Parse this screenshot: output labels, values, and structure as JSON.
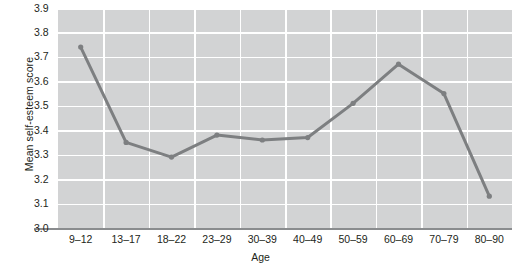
{
  "chart_data": {
    "type": "line",
    "title": "",
    "xlabel": "Age",
    "ylabel": "Mean self-esteem score",
    "categories": [
      "9–12",
      "13–17",
      "18–22",
      "23–29",
      "30–39",
      "40–49",
      "50–59",
      "60–69",
      "70–79",
      "80–90"
    ],
    "values": [
      3.74,
      3.35,
      3.29,
      3.38,
      3.36,
      3.37,
      3.51,
      3.67,
      3.55,
      3.13
    ],
    "series": [
      {
        "name": "Mean self-esteem score",
        "values": [
          3.74,
          3.35,
          3.29,
          3.38,
          3.36,
          3.37,
          3.51,
          3.67,
          3.55,
          3.13
        ]
      }
    ],
    "ylim": [
      3.0,
      3.9
    ],
    "yticks": [
      "3.0",
      "3.1",
      "3.2",
      "3.3",
      "3.4",
      "3.5",
      "3.6",
      "3.7",
      "3.8",
      "3.9"
    ],
    "ytick_values": [
      3.0,
      3.1,
      3.2,
      3.3,
      3.4,
      3.5,
      3.6,
      3.7,
      3.8,
      3.9
    ],
    "grid": true,
    "legend": false,
    "legend_position": "none",
    "line_color": "#7d7f81",
    "marker_color": "#7d7f81",
    "plot_background": "#d2d3d4",
    "gridline_color": "#ffffff",
    "axis_color": "#8a8c8e",
    "text_color": "#231f20"
  }
}
